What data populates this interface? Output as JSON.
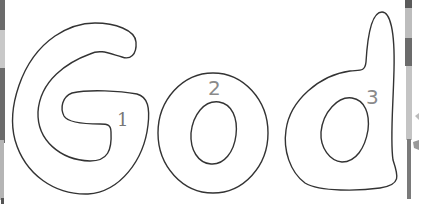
{
  "worksheet": {
    "word": "God",
    "letters": [
      {
        "char": "G",
        "number": "1"
      },
      {
        "char": "o",
        "number": "2"
      },
      {
        "char": "d",
        "number": "3"
      }
    ]
  },
  "colors": {
    "outline": "#333333",
    "number": "#8a8a8a",
    "background": "#ffffff",
    "strip_dark": "#6b6b6b",
    "strip_light": "#b5b5b5"
  }
}
